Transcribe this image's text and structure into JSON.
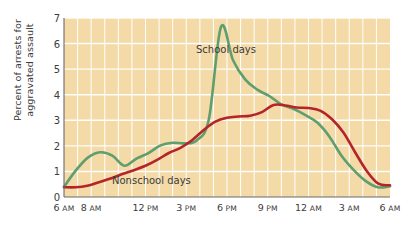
{
  "chart_data": {
    "type": "line",
    "title": "",
    "subtitle": "",
    "xlabel": "",
    "ylabel": "Percent of arrests for\naggravated assault",
    "ylim": [
      0,
      7
    ],
    "yticks": [
      0,
      1,
      2,
      3,
      4,
      5,
      6,
      7
    ],
    "ytick_labels": [
      "0",
      "1",
      "2",
      "3",
      "4",
      "5",
      "6",
      "7"
    ],
    "xlim": [
      0,
      24
    ],
    "x_hours": [
      0,
      1,
      2,
      3,
      4,
      5,
      6,
      7,
      8,
      9,
      10,
      11,
      12,
      13,
      14,
      15,
      16,
      17,
      18,
      19,
      20,
      21,
      22,
      23,
      24
    ],
    "xticks": [
      0,
      2,
      6,
      9,
      12,
      15,
      18,
      21,
      24
    ],
    "xtick_labels": [
      "6 AM",
      "8 AM",
      "12 PM",
      "3 PM",
      "6 PM",
      "9 PM",
      "12 AM",
      "3 AM",
      "6 AM"
    ],
    "xtick_nums": [
      "6",
      "8",
      "12",
      "3",
      "6",
      "9",
      "12",
      "3",
      "6"
    ],
    "xtick_meridiem": [
      "AM",
      "AM",
      "PM",
      "PM",
      "PM",
      "PM",
      "AM",
      "AM",
      "AM"
    ],
    "grid": true,
    "grid_color": "#ffffff",
    "plot_background": "#f3daa6",
    "legend_position": "inline-annotation",
    "series": [
      {
        "name": "School days",
        "color": "#5f9e6e",
        "values": [
          0.4,
          1.05,
          1.55,
          1.75,
          1.62,
          1.22,
          1.5,
          1.72,
          2.02,
          2.12,
          2.1,
          2.22,
          3.05,
          6.65,
          5.35,
          4.6,
          4.2,
          3.95,
          3.62,
          3.45,
          3.2,
          2.9,
          2.35,
          1.6,
          1.05,
          0.62,
          0.38,
          0.42
        ]
      },
      {
        "name": "Nonschool days",
        "color": "#b4242a",
        "values": [
          0.38,
          0.38,
          0.44,
          0.58,
          0.72,
          0.9,
          1.05,
          1.22,
          1.45,
          1.72,
          1.92,
          2.22,
          2.62,
          2.95,
          3.1,
          3.15,
          3.18,
          3.32,
          3.6,
          3.58,
          3.5,
          3.48,
          3.38,
          3.05,
          2.52,
          1.75,
          1.02,
          0.52,
          0.46
        ]
      }
    ],
    "annotations": [
      {
        "text": "School days",
        "x_px": 196,
        "y_px": 44
      },
      {
        "text": "Nonschool days",
        "x_px": 112,
        "y_px": 175
      }
    ]
  },
  "figure": {
    "plot_left_px": 64,
    "plot_right_px": 390,
    "plot_top_px": 18,
    "plot_bottom_px": 197
  }
}
